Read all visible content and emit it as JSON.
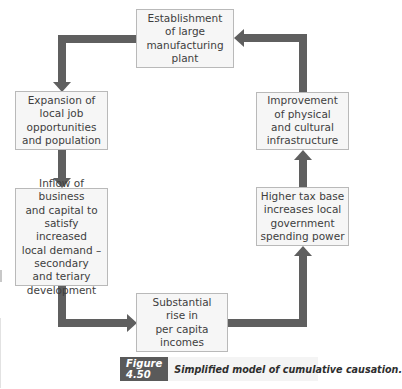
{
  "diagram": {
    "type": "cycle-flow",
    "direction": "clockwise",
    "nodes": [
      {
        "id": "top",
        "label": "Establishment\nof large\nmanufacturing\nplant"
      },
      {
        "id": "left1",
        "label": "Expansion of\nlocal job\nopportunities\nand population"
      },
      {
        "id": "left2",
        "label": "Inflow of business\nand capital to\nsatisfy increased\nlocal demand –\nsecondary\nand teriary\ndevelopment"
      },
      {
        "id": "bottom",
        "label": "Substantial\nrise in\nper capita\nincomes"
      },
      {
        "id": "right2",
        "label": "Higher tax base\nincreases local\ngovernment\nspending power"
      },
      {
        "id": "right1",
        "label": "Improvement\nof physical\nand cultural\ninfrastructure"
      }
    ],
    "edges": [
      {
        "from": "top",
        "to": "left1"
      },
      {
        "from": "left1",
        "to": "left2"
      },
      {
        "from": "left2",
        "to": "bottom"
      },
      {
        "from": "bottom",
        "to": "right2"
      },
      {
        "from": "right2",
        "to": "right1"
      },
      {
        "from": "right1",
        "to": "top"
      }
    ],
    "colors": {
      "arrow": "#5f5f5f",
      "box_fill": "#f6f6f6",
      "box_border": "#b9b9b9",
      "figure_label_bg": "#5a5a5a"
    }
  },
  "caption": {
    "figure_label": "Figure 4.50",
    "title": "Simplified model of cumulative causation."
  }
}
